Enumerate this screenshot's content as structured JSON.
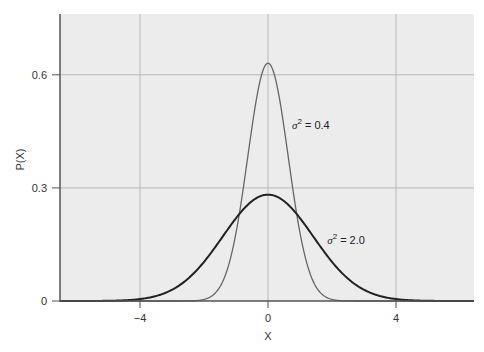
{
  "chart_data": {
    "type": "line",
    "title": "",
    "xlabel": "X",
    "ylabel": "P(X)",
    "xlim": [
      -6.5,
      6.5
    ],
    "ylim": [
      0,
      0.75
    ],
    "xticks": [
      -4,
      0,
      4
    ],
    "xtick_labels": [
      "−4",
      "0",
      "4"
    ],
    "yticks": [
      0,
      0.3,
      0.6
    ],
    "ytick_labels": [
      "0",
      "0.3",
      "0.6"
    ],
    "grid": true,
    "legend": null,
    "series": [
      {
        "name": "σ² = 0.4",
        "variance": 0.4,
        "mean": 0,
        "peak": 0.63,
        "color": "#666666",
        "line_width": 1.3,
        "x": [
          -3,
          -2,
          -1.5,
          -1,
          -0.5,
          0,
          0.5,
          1,
          1.5,
          2,
          3
        ],
        "y": [
          0.0,
          0.004,
          0.038,
          0.181,
          0.46,
          0.631,
          0.46,
          0.181,
          0.038,
          0.004,
          0.0
        ]
      },
      {
        "name": "σ² = 2.0",
        "variance": 2.0,
        "mean": 0,
        "peak": 0.28,
        "color": "#222222",
        "line_width": 2,
        "x": [
          -6,
          -4,
          -3,
          -2,
          -1,
          0,
          1,
          2,
          3,
          4,
          6
        ],
        "y": [
          0.0,
          0.005,
          0.029,
          0.104,
          0.22,
          0.282,
          0.22,
          0.104,
          0.029,
          0.005,
          0.0
        ]
      }
    ],
    "annotations": [
      {
        "text_sym": "σ",
        "sup": "2",
        "text_rest": " = 0.4",
        "x": 0.75,
        "y": 0.455
      },
      {
        "text_sym": "σ",
        "sup": "2",
        "text_rest": " = 2.0",
        "x": 1.85,
        "y": 0.15
      }
    ]
  },
  "layout": {
    "plot_left": 60,
    "plot_right": 474,
    "plot_top": 14,
    "plot_bottom": 301,
    "x_px_per_unit": 32,
    "x_zero_px": 268,
    "y_px_per_unit": 377,
    "background": "#ececec",
    "grid_color": "#b8b8b8",
    "axis_color": "#555555"
  }
}
